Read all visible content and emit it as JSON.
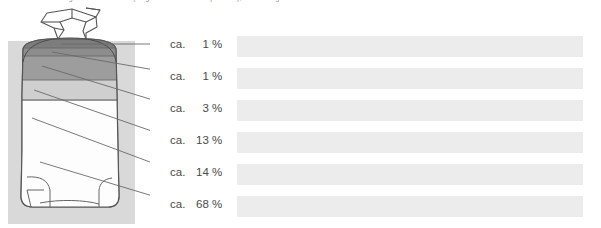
{
  "figure": {
    "title_clipped": "Zusammensetzung des Sackinhalts (Angaben in Gewichtsprozent), Restmenge",
    "illustration": {
      "name": "sack-illustration",
      "description": "paper sack with twisted top, horizontal stratified layers",
      "background_panel_color": "#d9d9d9",
      "bag_fill_color": "#ffffff",
      "outline_color": "#555555"
    },
    "layers": [
      {
        "id": "layer-1",
        "label_prefix": "ca.",
        "value": "1",
        "unit": "%",
        "band_color": "#7d7d7d",
        "y": 46
      },
      {
        "id": "layer-2",
        "label_prefix": "ca.",
        "value": "1",
        "unit": "%",
        "band_color": "#8a8a8a",
        "y": 72
      },
      {
        "id": "layer-3",
        "label_prefix": "ca.",
        "value": "3",
        "unit": "%",
        "band_color": "#a6a6a6",
        "y": 101
      },
      {
        "id": "layer-4",
        "label_prefix": "ca.",
        "value": "13",
        "unit": "%",
        "band_color": "#c9c9c9",
        "y": 135
      },
      {
        "id": "layer-5",
        "label_prefix": "ca.",
        "value": "14",
        "unit": "%",
        "band_color": "#e0e0e0",
        "y": 167
      },
      {
        "id": "layer-6",
        "label_prefix": "ca.",
        "value": "68",
        "unit": "%",
        "band_color": "#f2f2f2",
        "y": 198
      }
    ],
    "redacted_bars": {
      "name": "redacted-caption-bars",
      "color": "#ececec",
      "count": 6,
      "left": 237,
      "width": 346,
      "height": 21,
      "tops": [
        36,
        68,
        100,
        132,
        164,
        196
      ]
    }
  }
}
